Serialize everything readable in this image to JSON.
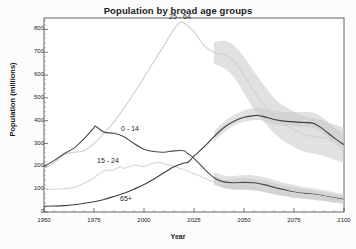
{
  "chart_data": {
    "type": "line",
    "title": "Population by broad age groups",
    "xlabel": "Year",
    "ylabel": "Population (millions)",
    "xlim": [
      1950,
      2100
    ],
    "ylim": [
      0,
      850
    ],
    "xticks": [
      1950,
      1975,
      2000,
      2025,
      2050,
      2075,
      2100
    ],
    "yticks": [
      0,
      100,
      200,
      300,
      400,
      500,
      600,
      700,
      800
    ],
    "grid": false,
    "legend": "inline-annotations",
    "projection_start": 2035,
    "annotations": [
      {
        "text": "25 - 64",
        "x": 2018,
        "y": 845
      },
      {
        "text": "0 - 14",
        "x": 1993,
        "y": 355
      },
      {
        "text": "15 - 24",
        "x": 1982,
        "y": 215
      },
      {
        "text": "65+",
        "x": 1991,
        "y": 48
      }
    ],
    "series": [
      {
        "name": "25 - 64",
        "color": "#d0d0d0",
        "x": [
          1950,
          1955,
          1960,
          1965,
          1970,
          1975,
          1980,
          1985,
          1990,
          1995,
          2000,
          2005,
          2010,
          2015,
          2018,
          2020,
          2025,
          2030,
          2035,
          2040,
          2045,
          2050,
          2055,
          2060,
          2065,
          2070,
          2075,
          2080,
          2085,
          2090,
          2095,
          2100
        ],
        "values": [
          190,
          215,
          250,
          262,
          268,
          300,
          345,
          395,
          455,
          520,
          590,
          660,
          730,
          800,
          830,
          828,
          790,
          730,
          700,
          690,
          660,
          600,
          530,
          470,
          420,
          385,
          360,
          340,
          330,
          325,
          310,
          295
        ],
        "band_lower": [
          null,
          null,
          null,
          null,
          null,
          null,
          null,
          null,
          null,
          null,
          null,
          null,
          null,
          null,
          null,
          null,
          null,
          null,
          650,
          630,
          590,
          520,
          450,
          395,
          345,
          310,
          285,
          265,
          255,
          245,
          230,
          215
        ],
        "band_upper": [
          null,
          null,
          null,
          null,
          null,
          null,
          null,
          null,
          null,
          null,
          null,
          null,
          null,
          null,
          null,
          null,
          null,
          null,
          745,
          750,
          730,
          680,
          615,
          555,
          500,
          465,
          440,
          420,
          410,
          400,
          385,
          370
        ]
      },
      {
        "name": "0 - 14",
        "color": "#4a4a4a",
        "x": [
          1950,
          1955,
          1960,
          1965,
          1970,
          1975,
          1976,
          1980,
          1985,
          1990,
          1995,
          2000,
          2005,
          2010,
          2015,
          2020,
          2022,
          2025,
          2030,
          2035,
          2040,
          2045,
          2050,
          2055,
          2060,
          2065,
          2070,
          2075,
          2080,
          2085,
          2090,
          2095,
          2100
        ],
        "values": [
          200,
          225,
          255,
          280,
          320,
          370,
          375,
          350,
          345,
          330,
          300,
          275,
          265,
          262,
          268,
          268,
          255,
          235,
          190,
          150,
          132,
          128,
          130,
          128,
          120,
          108,
          98,
          88,
          82,
          78,
          70,
          62,
          55
        ],
        "band_lower": [
          null,
          null,
          null,
          null,
          null,
          null,
          null,
          null,
          null,
          null,
          null,
          null,
          null,
          null,
          null,
          null,
          null,
          null,
          null,
          125,
          105,
          98,
          98,
          95,
          88,
          78,
          70,
          62,
          58,
          54,
          48,
          42,
          38
        ],
        "band_upper": [
          null,
          null,
          null,
          null,
          null,
          null,
          null,
          null,
          null,
          null,
          null,
          null,
          null,
          null,
          null,
          null,
          null,
          null,
          null,
          175,
          160,
          158,
          162,
          160,
          152,
          140,
          128,
          118,
          110,
          104,
          95,
          86,
          78
        ]
      },
      {
        "name": "15 - 24",
        "color": "#d6d6d6",
        "x": [
          1950,
          1955,
          1960,
          1965,
          1970,
          1975,
          1980,
          1985,
          1988,
          1990,
          1995,
          2000,
          2005,
          2008,
          2010,
          2015,
          2020,
          2025,
          2030,
          2035,
          2040,
          2045,
          2050,
          2055,
          2060,
          2065,
          2070,
          2075,
          2080,
          2085,
          2090,
          2095,
          2100
        ],
        "values": [
          100,
          100,
          102,
          108,
          125,
          150,
          180,
          185,
          200,
          192,
          205,
          200,
          215,
          218,
          212,
          200,
          185,
          168,
          150,
          132,
          120,
          118,
          120,
          118,
          112,
          102,
          92,
          84,
          78,
          74,
          68,
          60,
          52
        ],
        "band_lower": [
          null,
          null,
          null,
          null,
          null,
          null,
          null,
          null,
          null,
          null,
          null,
          null,
          null,
          null,
          null,
          null,
          null,
          null,
          null,
          118,
          105,
          98,
          98,
          95,
          88,
          78,
          70,
          62,
          58,
          54,
          48,
          42,
          36
        ],
        "band_upper": [
          null,
          null,
          null,
          null,
          null,
          null,
          null,
          null,
          null,
          null,
          null,
          null,
          null,
          null,
          null,
          null,
          null,
          null,
          null,
          152,
          142,
          145,
          148,
          145,
          138,
          126,
          116,
          108,
          100,
          94,
          86,
          78,
          70
        ]
      },
      {
        "name": "65+",
        "color": "#3d3d3d",
        "x": [
          1950,
          1955,
          1960,
          1965,
          1970,
          1975,
          1980,
          1985,
          1990,
          1995,
          2000,
          2005,
          2010,
          2015,
          2020,
          2022,
          2025,
          2030,
          2035,
          2040,
          2045,
          2050,
          2055,
          2057,
          2060,
          2065,
          2070,
          2075,
          2080,
          2085,
          2090,
          2095,
          2100
        ],
        "values": [
          25,
          26,
          28,
          32,
          38,
          45,
          55,
          68,
          82,
          100,
          120,
          145,
          172,
          198,
          215,
          218,
          245,
          285,
          330,
          370,
          398,
          415,
          422,
          423,
          418,
          405,
          398,
          395,
          392,
          388,
          360,
          325,
          295
        ],
        "band_lower": [
          null,
          null,
          null,
          null,
          null,
          null,
          null,
          null,
          null,
          null,
          null,
          null,
          null,
          null,
          null,
          null,
          null,
          null,
          308,
          348,
          378,
          395,
          402,
          403,
          398,
          385,
          378,
          375,
          372,
          368,
          340,
          302,
          268
        ],
        "band_upper": [
          null,
          null,
          null,
          null,
          null,
          null,
          null,
          null,
          null,
          null,
          null,
          null,
          null,
          null,
          null,
          null,
          null,
          null,
          352,
          395,
          425,
          445,
          455,
          456,
          452,
          442,
          438,
          438,
          438,
          435,
          408,
          372,
          342
        ]
      }
    ]
  },
  "axes": {
    "ytick_labels": [
      "800",
      "700",
      "600",
      "500",
      "400",
      "300",
      "200",
      "100",
      "0"
    ],
    "xtick_labels": [
      "1950",
      "1975",
      "2000",
      "2025",
      "2050",
      "2075",
      "2100"
    ]
  },
  "style": {
    "band_color": "#c8c8c8",
    "frame_color": "#555555",
    "text_color": "#1a1a1a"
  }
}
